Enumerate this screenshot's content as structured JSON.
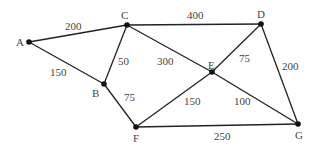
{
  "graph": {
    "nodes": [
      {
        "id": "A",
        "x": 29,
        "y": 42,
        "lx": 16,
        "ly": 37
      },
      {
        "id": "B",
        "x": 104,
        "y": 84,
        "lx": 92,
        "ly": 88
      },
      {
        "id": "C",
        "x": 127,
        "y": 25,
        "lx": 121,
        "ly": 10
      },
      {
        "id": "D",
        "x": 261,
        "y": 24,
        "lx": 257,
        "ly": 9
      },
      {
        "id": "E",
        "x": 212,
        "y": 72,
        "lx": 208,
        "ly": 60
      },
      {
        "id": "F",
        "x": 136,
        "y": 127,
        "lx": 133,
        "ly": 133
      },
      {
        "id": "G",
        "x": 298,
        "y": 124,
        "lx": 295,
        "ly": 130
      }
    ],
    "edges": [
      {
        "from": "A",
        "to": "C",
        "weight": "200",
        "lx": 65,
        "ly": 21
      },
      {
        "from": "A",
        "to": "B",
        "weight": "150",
        "lx": 50,
        "ly": 67
      },
      {
        "from": "C",
        "to": "B",
        "weight": "50",
        "lx": 118,
        "ly": 56
      },
      {
        "from": "C",
        "to": "D",
        "weight": "400",
        "lx": 187,
        "ly": 10
      },
      {
        "from": "C",
        "to": "E",
        "weight": "300",
        "lx": 157,
        "ly": 56
      },
      {
        "from": "B",
        "to": "F",
        "weight": "75",
        "lx": 124,
        "ly": 92
      },
      {
        "from": "E",
        "to": "D",
        "weight": "75",
        "lx": 239,
        "ly": 53
      },
      {
        "from": "D",
        "to": "G",
        "weight": "200",
        "lx": 282,
        "ly": 61
      },
      {
        "from": "F",
        "to": "E",
        "weight": "150",
        "lx": 184,
        "ly": 96
      },
      {
        "from": "E",
        "to": "G",
        "weight": "100",
        "lx": 234,
        "ly": 96
      },
      {
        "from": "F",
        "to": "G",
        "weight": "250",
        "lx": 214,
        "ly": 131
      }
    ]
  }
}
